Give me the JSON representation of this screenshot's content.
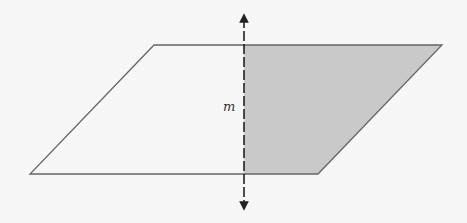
{
  "diagram": {
    "type": "plane-with-perpendicular-line",
    "line_label": "m",
    "colors": {
      "background": "#f7f7f7",
      "outline": "#666666",
      "shaded_region": "#c9c9c9",
      "line": "#222222"
    },
    "parallelogram": {
      "top_left": [
        154,
        45
      ],
      "top_right": [
        442,
        45
      ],
      "bottom_right": [
        318,
        174
      ],
      "bottom_left": [
        30,
        174
      ]
    },
    "line_m": {
      "x": 244,
      "y_top": 12,
      "y_bottom": 212,
      "style": "dashed",
      "arrowheads": "both"
    },
    "shaded_side": "right of line m"
  }
}
